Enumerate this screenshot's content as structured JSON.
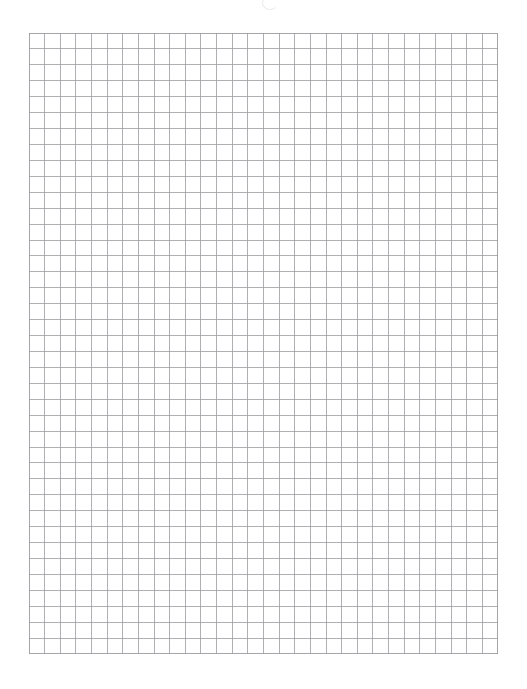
{
  "document": {
    "type": "graph-paper-sheet",
    "title": "Blank Graph Paper",
    "page_width": 527,
    "page_height": 689,
    "background_color": "#ffffff"
  },
  "artifact": {
    "name": "faint-mark",
    "description": "faint partial circular glyph artifact at top center",
    "color": "#d8dade",
    "x": 262,
    "y": -4
  },
  "grid": {
    "label": "Graph paper grid",
    "x": 29,
    "y": 33,
    "width": 469,
    "height": 621,
    "columns": 30,
    "rows": 39,
    "cell_width": 15.633,
    "cell_height": 15.923,
    "line_color": "#9a9ca0",
    "line_width": 0.8,
    "border_color": "#9a9ca0",
    "border_width": 0.9,
    "fill_color": "#ffffff"
  }
}
